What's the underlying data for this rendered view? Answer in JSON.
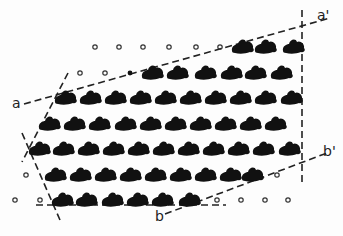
{
  "diagram": {
    "type": "crystal lattice with unit-cell boundary lines",
    "labels": {
      "a": "a",
      "a_prime": "a'",
      "b": "b",
      "b_prime": "b'"
    },
    "colors": {
      "blob": "#111111",
      "circle": "#333333",
      "line": "#222222",
      "background": "#fdfdfd"
    },
    "rows": [
      {
        "y": 47,
        "circles": [
          95,
          119,
          143,
          169,
          196,
          220
        ],
        "blobs": [
          243,
          266,
          294
        ]
      },
      {
        "y": 73,
        "circles": [
          80,
          105
        ],
        "dots": [
          130
        ],
        "blobs": [
          153,
          178,
          206,
          232,
          256,
          282
        ]
      },
      {
        "y": 98,
        "circles": [],
        "blobs": [
          66,
          91,
          116,
          141,
          166,
          191,
          216,
          241,
          266,
          292
        ]
      },
      {
        "y": 124,
        "circles": [],
        "blobs": [
          50,
          75,
          100,
          126,
          151,
          176,
          201,
          226,
          251,
          276
        ]
      },
      {
        "y": 149,
        "circles": [],
        "blobs": [
          40,
          64,
          89,
          114,
          139,
          164,
          189,
          214,
          239,
          264,
          290
        ]
      },
      {
        "y": 175,
        "circles": [
          26,
          277
        ],
        "blobs": [
          56,
          81,
          106,
          131,
          156,
          181,
          206,
          231,
          253
        ]
      },
      {
        "y": 200,
        "circles": [
          15,
          40,
          217,
          241,
          265,
          288
        ],
        "blobs": [
          63,
          87,
          113,
          138,
          163,
          190
        ]
      }
    ],
    "lines": [
      {
        "name": "a-a-prime-line",
        "x1": 24,
        "y1": 104,
        "x2": 330,
        "y2": 18
      },
      {
        "name": "vertical-right-line",
        "x1": 302,
        "y1": 10,
        "x2": 302,
        "y2": 182
      },
      {
        "name": "b-b-prime-line",
        "x1": 165,
        "y1": 214,
        "x2": 327,
        "y2": 153
      },
      {
        "name": "left-upper-slant-line",
        "x1": 68,
        "y1": 73,
        "x2": 22,
        "y2": 162
      },
      {
        "name": "left-lower-slant-line",
        "x1": 22,
        "y1": 133,
        "x2": 60,
        "y2": 220
      },
      {
        "name": "bottom-horizontal-line",
        "x1": 36,
        "y1": 205,
        "x2": 226,
        "y2": 205
      }
    ]
  }
}
